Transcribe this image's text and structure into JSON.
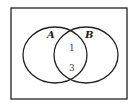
{
  "diagram": {
    "type": "venn",
    "sets": [
      {
        "label": "A"
      },
      {
        "label": "B"
      }
    ],
    "regions": {
      "intersection_top": "1",
      "intersection_bottom": "3"
    }
  }
}
